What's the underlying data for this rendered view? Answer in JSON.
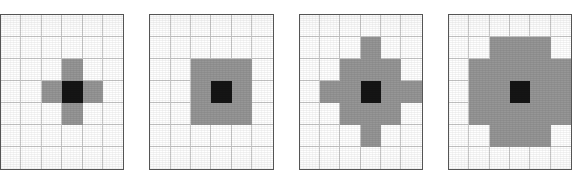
{
  "figure": {
    "title": "",
    "background_color": "#ffffff",
    "panel_count": 4,
    "panel_gap_px": 25
  },
  "style": {
    "fill_color": "#969696",
    "center_color": "#151515",
    "grid_line_color": "#c9c9c9",
    "border_color": "#555555",
    "empty_color": "#ffffff"
  },
  "chart_data": {
    "type": "heatmap",
    "title": "",
    "xlabel": "",
    "ylabel": "",
    "grid": true,
    "legend": "none",
    "panels": [
      {
        "index": 1,
        "name": "plus-mask",
        "label": "",
        "rows": 7,
        "cols": 6,
        "center": [
          3,
          2
        ],
        "cell_px": 22,
        "matrix": [
          [
            0,
            0,
            0,
            0,
            0,
            0
          ],
          [
            0,
            0,
            0,
            0,
            0,
            0
          ],
          [
            0,
            0,
            0,
            1,
            0,
            0
          ],
          [
            0,
            0,
            1,
            2,
            1,
            0
          ],
          [
            0,
            0,
            0,
            1,
            0,
            0
          ],
          [
            0,
            0,
            0,
            0,
            0,
            0
          ],
          [
            0,
            0,
            0,
            0,
            0,
            0
          ]
        ]
      },
      {
        "index": 2,
        "name": "square-3x3-mask",
        "label": "",
        "rows": 7,
        "cols": 6,
        "center": [
          3,
          2
        ],
        "cell_px": 22,
        "matrix": [
          [
            0,
            0,
            0,
            0,
            0,
            0
          ],
          [
            0,
            0,
            0,
            0,
            0,
            0
          ],
          [
            0,
            0,
            1,
            1,
            1,
            0
          ],
          [
            0,
            0,
            1,
            2,
            1,
            0
          ],
          [
            0,
            0,
            1,
            1,
            1,
            0
          ],
          [
            0,
            0,
            0,
            0,
            0,
            0
          ],
          [
            0,
            0,
            0,
            0,
            0,
            0
          ]
        ]
      },
      {
        "index": 3,
        "name": "diamond-mask",
        "label": "",
        "rows": 7,
        "cols": 6,
        "center": [
          3,
          2
        ],
        "cell_px": 22,
        "matrix": [
          [
            0,
            0,
            0,
            0,
            0,
            0
          ],
          [
            0,
            0,
            0,
            1,
            0,
            0
          ],
          [
            0,
            0,
            1,
            1,
            1,
            0
          ],
          [
            0,
            1,
            1,
            2,
            1,
            1
          ],
          [
            0,
            0,
            1,
            1,
            1,
            0
          ],
          [
            0,
            0,
            0,
            1,
            0,
            0
          ],
          [
            0,
            0,
            0,
            0,
            0,
            0
          ]
        ]
      },
      {
        "index": 4,
        "name": "octagon-mask",
        "label": "",
        "rows": 7,
        "cols": 6,
        "center": [
          3,
          2
        ],
        "cell_px": 22,
        "matrix": [
          [
            0,
            0,
            0,
            0,
            0,
            0
          ],
          [
            0,
            0,
            1,
            1,
            1,
            0
          ],
          [
            0,
            1,
            1,
            1,
            1,
            1
          ],
          [
            0,
            1,
            1,
            2,
            1,
            1
          ],
          [
            0,
            1,
            1,
            1,
            1,
            1
          ],
          [
            0,
            0,
            1,
            1,
            1,
            0
          ],
          [
            0,
            0,
            0,
            0,
            0,
            0
          ]
        ]
      }
    ],
    "value_legend": {
      "0": "empty / background",
      "1": "mask cell (gray)",
      "2": "centre cell (black)"
    }
  }
}
